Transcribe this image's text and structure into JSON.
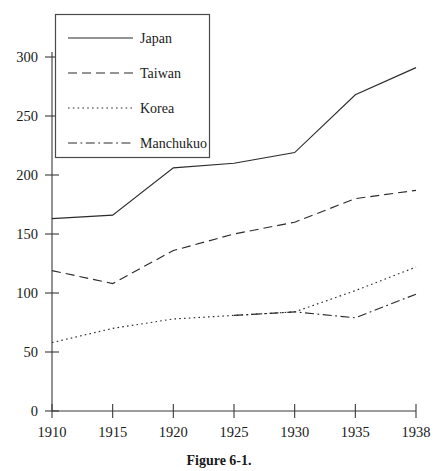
{
  "caption": "Figure 6-1.",
  "chart_data": {
    "type": "line",
    "title": "",
    "subtitle": "",
    "xlabel": "",
    "ylabel": "",
    "x": [
      "1910",
      "1915",
      "1920",
      "1925",
      "1930",
      "1935",
      "1938"
    ],
    "categories": [
      "1910",
      "1915",
      "1920",
      "1925",
      "1930",
      "1935",
      "1938"
    ],
    "xlim": [
      1910,
      1938
    ],
    "ylim": [
      0,
      300
    ],
    "y_ticks": [
      0,
      50,
      100,
      150,
      200,
      250,
      300
    ],
    "x_ticks": [
      "1910",
      "1915",
      "1920",
      "1925",
      "1930",
      "1935",
      "1938"
    ],
    "grid": false,
    "legend_position": "upper-left",
    "series": [
      {
        "name": "Japan",
        "style": "solid",
        "values": [
          163,
          166,
          206,
          210,
          219,
          268,
          291
        ]
      },
      {
        "name": "Taiwan",
        "style": "dashed",
        "values": [
          119,
          108,
          136,
          150,
          160,
          180,
          187
        ]
      },
      {
        "name": "Korea",
        "style": "dotted",
        "values": [
          58,
          70,
          78,
          81,
          84,
          102,
          122
        ]
      },
      {
        "name": "Manchukuo",
        "style": "dash-dot",
        "values": [
          null,
          null,
          null,
          81,
          84,
          79,
          99
        ]
      }
    ]
  },
  "legend": {
    "entries": [
      {
        "label": "Japan",
        "style": "solid"
      },
      {
        "label": "Taiwan",
        "style": "dashed"
      },
      {
        "label": "Korea",
        "style": "dotted"
      },
      {
        "label": "Manchukuo",
        "style": "dash-dot"
      }
    ]
  },
  "axis": {
    "y_tick_labels": [
      "300",
      "250",
      "200",
      "150",
      "100",
      "50",
      "0"
    ],
    "x_tick_labels": [
      "1910",
      "1915",
      "1920",
      "1925",
      "1930",
      "1935",
      "1938"
    ]
  }
}
